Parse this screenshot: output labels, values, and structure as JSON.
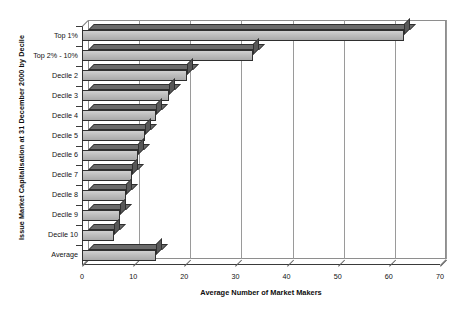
{
  "chart_data": {
    "type": "bar",
    "orientation": "horizontal",
    "title": "",
    "xlabel": "Average Number of Market Makers",
    "ylabel": "Issue Market Capitalisation at 31 December 2000 by Decile",
    "xlim": [
      0,
      70
    ],
    "xticks": [
      0,
      10,
      20,
      30,
      40,
      50,
      60,
      70
    ],
    "grid": true,
    "legend": false,
    "style_3d": true,
    "categories": [
      "Top 1%",
      "Top 2% - 10%",
      "Decile 2",
      "Decile 3",
      "Decile 4",
      "Decile 5",
      "Decile 6",
      "Decile 7",
      "Decile 8",
      "Decile 9",
      "Decile 10",
      "Average"
    ],
    "values": [
      63,
      33.5,
      20.5,
      17,
      14.5,
      12.4,
      11,
      9.7,
      8.7,
      7.4,
      6.2,
      14.5
    ],
    "series": [
      {
        "name": "Average Number of Market Makers",
        "values": [
          63,
          33.5,
          20.5,
          17,
          14.5,
          12.4,
          11,
          9.7,
          8.7,
          7.4,
          6.2,
          14.5
        ]
      }
    ],
    "colors": {
      "bar_face": "#b7b7b7",
      "bar_top": "#6a6a6a",
      "bar_side": "#585858",
      "bar_outline": "#2f2f2f",
      "gridline": "#9a9a9a",
      "axis": "#3a3a3a",
      "background": "#ffffff"
    }
  },
  "axes": {
    "x_tick_labels": [
      "0",
      "10",
      "20",
      "30",
      "40",
      "50",
      "60",
      "70"
    ],
    "x_title": "Average Number of Market Makers",
    "y_title": "Issue Market Capitalisation at 31 December 2000 by Decile"
  }
}
